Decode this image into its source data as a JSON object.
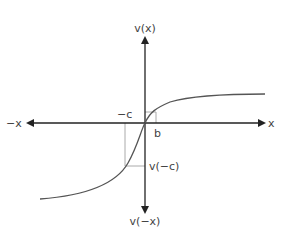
{
  "diagram": {
    "type": "value-function-graph",
    "labels": {
      "y_pos": "v(x)",
      "y_neg": "v(−x)",
      "x_pos": "x",
      "x_neg": "−x",
      "neg_c": "−c",
      "b": "b",
      "v_neg_c": "v(−c)"
    },
    "colors": {
      "axis": "#222222",
      "curve": "#555555",
      "guide": "#aaaaaa",
      "text": "#444444"
    }
  }
}
